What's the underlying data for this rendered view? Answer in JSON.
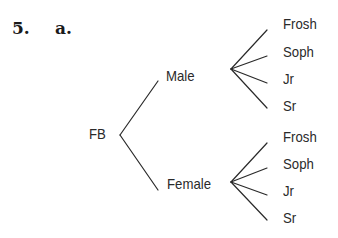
{
  "problem": {
    "number": "5.",
    "part": "a."
  },
  "tree": {
    "root": "FB",
    "level1": [
      {
        "label": "Male",
        "children": [
          "Frosh",
          "Soph",
          "Jr",
          "Sr"
        ]
      },
      {
        "label": "Female",
        "children": [
          "Frosh",
          "Soph",
          "Jr",
          "Sr"
        ]
      }
    ]
  }
}
